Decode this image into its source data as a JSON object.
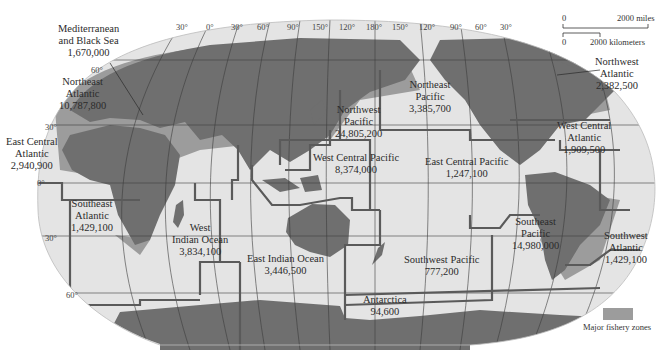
{
  "map": {
    "title": "Major fishery zones of the world ocean",
    "colors": {
      "ocean": "#e4e4e4",
      "land": "#6f6f6f",
      "fishery": "#9c9c9c",
      "boundary": "#5a5a5a",
      "graticule": "#3c3c3c",
      "background": "#ffffff"
    },
    "longitude_labels": [
      "30°",
      "0°",
      "30°",
      "60°",
      "90°",
      "150°",
      "120°",
      "180°",
      "150°",
      "120°",
      "90°",
      "60°",
      "30°"
    ],
    "latitude_labels": [
      "60°",
      "30°",
      "0°",
      "30°",
      "60°"
    ],
    "scale_bar": {
      "miles_start": "0",
      "miles_end": "2000 miles",
      "km_start": "0",
      "km_end": "2000 kilometers"
    },
    "legend": {
      "label": "Major fishery zones"
    },
    "zones": [
      {
        "name_lines": [
          "Mediterranean",
          "and Black Sea"
        ],
        "value": "1,670,000"
      },
      {
        "name_lines": [
          "Northeast",
          "Atlantic"
        ],
        "value": "10,787,800"
      },
      {
        "name_lines": [
          "East Central",
          "Atlantic"
        ],
        "value": "2,940,900"
      },
      {
        "name_lines": [
          "Southeast",
          "Atlantic"
        ],
        "value": "1,429,100"
      },
      {
        "name_lines": [
          "West",
          "Indian Ocean"
        ],
        "value": "3,834,100"
      },
      {
        "name_lines": [
          "East Indian Ocean"
        ],
        "value": "3,446,500"
      },
      {
        "name_lines": [
          "Northwest",
          "Pacific"
        ],
        "value": "24,805,200"
      },
      {
        "name_lines": [
          "Northeast",
          "Pacific"
        ],
        "value": "3,385,700"
      },
      {
        "name_lines": [
          "West Central Pacific"
        ],
        "value": "8,374,000"
      },
      {
        "name_lines": [
          "East Central Pacific"
        ],
        "value": "1,247,100"
      },
      {
        "name_lines": [
          "Southwest Pacific"
        ],
        "value": "777,200"
      },
      {
        "name_lines": [
          "Southeast",
          "Pacific"
        ],
        "value": "14,980,000"
      },
      {
        "name_lines": [
          "Antarctica"
        ],
        "value": "94,600"
      },
      {
        "name_lines": [
          "Northwest",
          "Atlantic"
        ],
        "value": "2,382,500"
      },
      {
        "name_lines": [
          "West Central",
          "Atlantic"
        ],
        "value": "1,909,500"
      },
      {
        "name_lines": [
          "Southwest",
          "Atlantic"
        ],
        "value": "1,429,100"
      }
    ]
  }
}
